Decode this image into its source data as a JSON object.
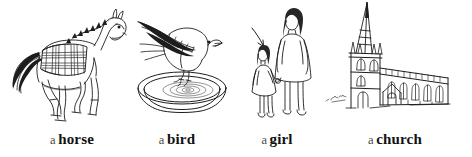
{
  "page": {
    "type": "illustrated-vocabulary-row",
    "background_color": "#ffffff",
    "ink_color": "#1d1d1d",
    "width": 472,
    "height": 157,
    "style": "pen-and-ink line drawings"
  },
  "items": [
    {
      "id": "horse",
      "article": "a",
      "noun": "horse",
      "caption": "a horse",
      "illustration": "horse-drawing",
      "description": "line drawing of a trotting horse facing right wearing a plaid tartan blanket, dark spiky mane and flowing tail"
    },
    {
      "id": "bird",
      "article": "a",
      "noun": "bird",
      "caption": "a bird",
      "illustration": "bird-drawing",
      "description": "line drawing of a small songbird facing right perched on the rim of a shallow dish of water with concentric ripples"
    },
    {
      "id": "girl",
      "article": "a",
      "noun": "girl",
      "caption": "a girl",
      "illustration": "girl-drawing",
      "description": "line drawing of a woman in a dress holding hands with a small girl, an arrow points down at the girl"
    },
    {
      "id": "church",
      "article": "a",
      "noun": "church",
      "caption": "a church",
      "illustration": "church-drawing",
      "description": "line drawing of a stone church with a tall pointed spire, pinnacled tower and long nave with arched windows, small artist signature at lower left"
    }
  ]
}
